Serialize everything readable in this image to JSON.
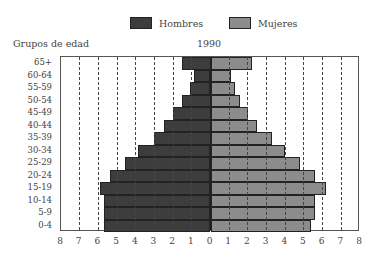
{
  "legend": [
    {
      "label": "Hombres",
      "color": "#3d3d3d"
    },
    {
      "label": "Mujeres",
      "color": "#8c8c8c"
    }
  ],
  "chart_data": {
    "type": "bar",
    "orientation": "horizontal-population-pyramid",
    "title": "1990",
    "ylabel": "Grupos de edad",
    "xlabel": "",
    "categories": [
      "65+",
      "60-64",
      "55-59",
      "50-54",
      "45-49",
      "40-44",
      "35-39",
      "30-34",
      "25-29",
      "20-24",
      "15-19",
      "10-14",
      "5-9",
      "0-4"
    ],
    "series": [
      {
        "name": "Hombres",
        "side": "left",
        "color": "#3d3d3d",
        "values": [
          1.5,
          0.9,
          1.1,
          1.5,
          2.0,
          2.5,
          3.0,
          3.9,
          4.6,
          5.4,
          5.9,
          5.7,
          5.7,
          5.7
        ]
      },
      {
        "name": "Mujeres",
        "side": "right",
        "color": "#8c8c8c",
        "values": [
          2.2,
          1.1,
          1.3,
          1.6,
          2.0,
          2.5,
          3.3,
          4.0,
          4.8,
          5.6,
          6.2,
          5.6,
          5.6,
          5.4
        ]
      }
    ],
    "xticks": [
      "8",
      "7",
      "6",
      "5",
      "4",
      "3",
      "2",
      "1",
      "0",
      "1",
      "2",
      "3",
      "4",
      "5",
      "6",
      "7",
      "8"
    ],
    "xlim": [
      -8,
      8
    ],
    "grid": "vertical dashed at each integer",
    "legend_position": "top"
  }
}
